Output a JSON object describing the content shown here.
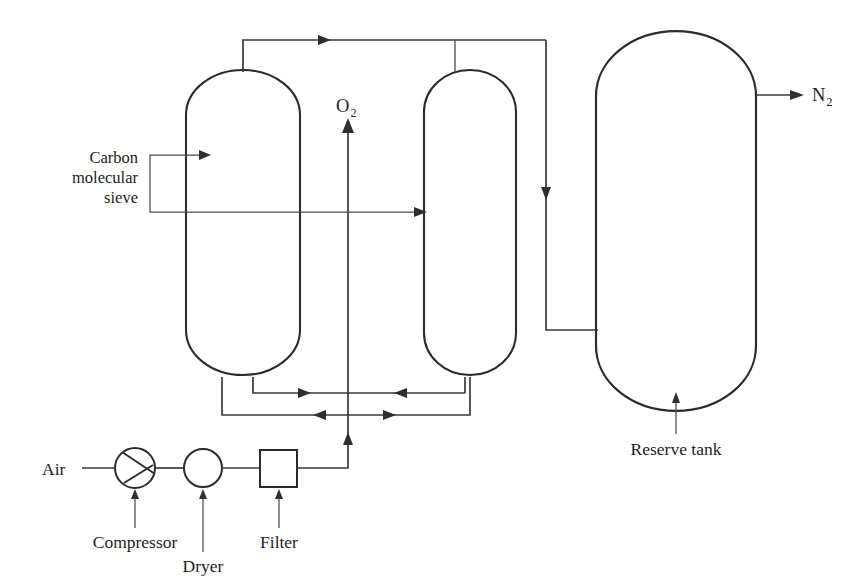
{
  "diagram": {
    "type": "process-flow-diagram",
    "stroke_color": "#2b2b2b",
    "pipe_color": "#3a3a3a",
    "background": "#ffffff",
    "labels": {
      "air": "Air",
      "compressor": "Compressor",
      "dryer": "Dryer",
      "filter": "Filter",
      "oxygen": "O",
      "oxygen_sub": "2",
      "nitrogen": "N",
      "nitrogen_sub": "2",
      "reserve_tank": "Reserve tank",
      "sieve_line1": "Carbon",
      "sieve_line2": "molecular",
      "sieve_line3": "sieve"
    },
    "equipment": [
      {
        "name": "compressor",
        "label": "Compressor",
        "shape": "circle-with-wedge",
        "cx": 135,
        "cy": 468,
        "r": 20
      },
      {
        "name": "dryer",
        "label": "Dryer",
        "shape": "circle",
        "cx": 203,
        "cy": 468,
        "r": 19
      },
      {
        "name": "filter",
        "label": "Filter",
        "shape": "square",
        "x": 260,
        "y": 450,
        "w": 37,
        "h": 37
      },
      {
        "name": "adsorber-vessel-left",
        "label": "Carbon molecular sieve",
        "shape": "rounded-vessel",
        "x": 186,
        "y": 70,
        "w": 114,
        "h": 305
      },
      {
        "name": "adsorber-vessel-right",
        "label": "Carbon molecular sieve",
        "shape": "rounded-vessel",
        "x": 424,
        "y": 70,
        "w": 92,
        "h": 305
      },
      {
        "name": "reserve-tank",
        "label": "Reserve tank",
        "shape": "rounded-vessel",
        "x": 596,
        "y": 31,
        "w": 160,
        "h": 380
      }
    ],
    "streams": [
      {
        "name": "air-inlet",
        "from": "Air",
        "to": "compressor"
      },
      {
        "name": "compressor-to-dryer",
        "from": "compressor",
        "to": "dryer"
      },
      {
        "name": "dryer-to-filter",
        "from": "dryer",
        "to": "filter"
      },
      {
        "name": "filter-to-manifold",
        "from": "filter",
        "to": "bottom-manifold"
      },
      {
        "name": "oxygen-vent",
        "from": "bottom-manifold",
        "to": "O2"
      },
      {
        "name": "vessel-tops-to-tank",
        "from": "adsorber-vessels",
        "to": "reserve-tank"
      },
      {
        "name": "nitrogen-product",
        "from": "reserve-tank",
        "to": "N2"
      }
    ]
  }
}
